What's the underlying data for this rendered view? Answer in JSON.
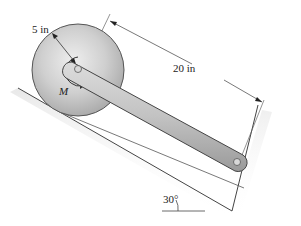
{
  "diagram": {
    "type": "mechanics-figure",
    "labels": {
      "disk_radius": "5 in",
      "rod_length": "20 in",
      "moment": "M",
      "incline_angle": "30°"
    },
    "values": {
      "disk_radius_in": 5,
      "rod_length_in": 20,
      "incline_angle_deg": 30
    },
    "components": [
      "disk",
      "rod",
      "pin-at-disk-center",
      "pin-at-rod-end",
      "inclined-plane",
      "end-wall",
      "applied-moment"
    ],
    "colors": {
      "disk_fill": "#c9c9c9",
      "rod_fill": "#c4c4c4",
      "line": "#444444",
      "dimension_line": "#555555"
    }
  }
}
